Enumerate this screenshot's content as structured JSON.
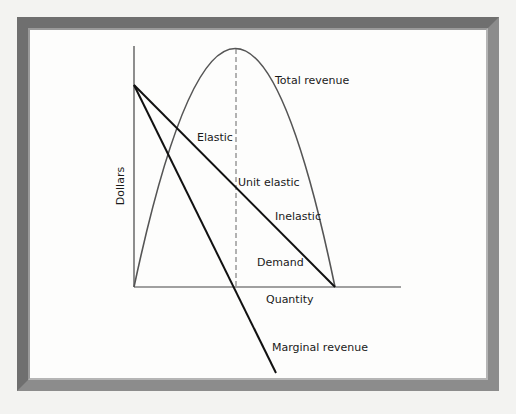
{
  "diagram": {
    "axes": {
      "y_label": "Dollars",
      "x_label": "Quantity"
    },
    "curves": {
      "total_revenue": "Total revenue",
      "demand": "Demand",
      "marginal_revenue": "Marginal revenue"
    },
    "regions": {
      "elastic": "Elastic",
      "unit_elastic": "Unit elastic",
      "inelastic": "Inelastic"
    },
    "colors": {
      "frame_dark": "#6f6f6f",
      "frame_light": "#8c8c8c",
      "curve_black": "#111111",
      "curve_gray": "#555555",
      "axis": "#444444"
    }
  }
}
